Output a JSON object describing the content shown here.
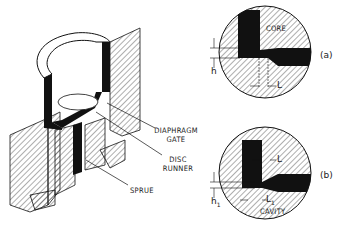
{
  "figure": {
    "main_view": {
      "labels": {
        "diaphragm_gate_line1": "DIAPHRAGM",
        "diaphragm_gate_line2": "GATE",
        "disc_runner_line1": "DISC",
        "disc_runner_line2": "RUNNER",
        "sprue": "SPRUE"
      }
    },
    "detail_a": {
      "caption": "(a)",
      "labels": {
        "core": "CORE",
        "h": "h",
        "L": "L"
      }
    },
    "detail_b": {
      "caption": "(b)",
      "labels": {
        "L": "L",
        "h1": "h",
        "h1_sub": "1",
        "L1": "L",
        "L1_sub": "1",
        "cavity": "CAVITY"
      }
    }
  },
  "colors": {
    "ink": "#111111",
    "background": "#ffffff",
    "hatch": "#333333"
  }
}
